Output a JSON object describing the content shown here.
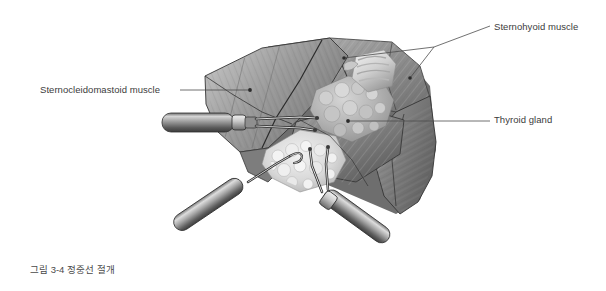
{
  "figure": {
    "caption": "그림 3-4  정중선 절개",
    "background_color": "#ffffff",
    "label_color": "#3b3b3b",
    "leader_color": "#4c4c4c",
    "illustration_type": "grayscale-medical-illustration"
  },
  "labels": {
    "sternohyoid": "Sternohyoid muscle",
    "sternocleidomastoid": "Sternocleidomastoid muscle",
    "thyroid": "Thyroid gland"
  },
  "palette": {
    "muscle_light": "#b4b4b4",
    "muscle_mid": "#8d8d8d",
    "muscle_dark": "#6a6a6a",
    "muscle_deepest": "#4e4e4e",
    "fat_light": "#e8e8e8",
    "fat_shadow": "#bdbdbd",
    "instrument_light": "#cfcfcf",
    "instrument_mid": "#8a8a8a",
    "instrument_dark": "#454545",
    "outline": "#2f2f2f"
  }
}
